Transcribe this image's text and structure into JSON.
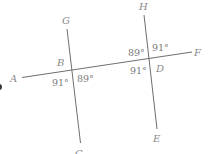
{
  "figure": {
    "type": "parallel-lines-transversal",
    "points": {
      "A": "A",
      "B": "B",
      "C": "C",
      "D": "D",
      "E": "E",
      "F": "F",
      "G": "G",
      "H": "H"
    },
    "angles": {
      "B_lower_left": "91°",
      "B_lower_right": "89°",
      "D_upper_left": "89°",
      "D_upper_right": "91°",
      "D_lower_left": "91°"
    },
    "colors": {
      "line": "#6f6f6f",
      "label": "#8a8a8a"
    }
  }
}
